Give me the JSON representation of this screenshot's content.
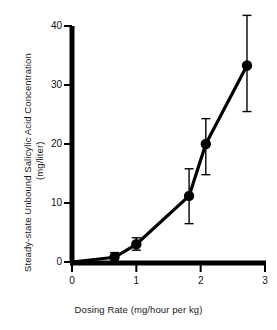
{
  "chart_data": {
    "type": "scatter",
    "title": "",
    "xlabel": "Dosing Rate (mg/hour per kg)",
    "ylabel": "Steady-state Unbound Salicylic Acid Concentration (mg/liter)",
    "ylabel_line1": "Steady-state Unbound Salicylic Acid Concentration",
    "ylabel_line2": "(mg/liter)",
    "xlim": [
      0,
      3
    ],
    "ylim": [
      0,
      40
    ],
    "xticks": [
      0,
      1,
      2,
      3
    ],
    "yticks": [
      0,
      10,
      20,
      30,
      40
    ],
    "xtick_labels": [
      "0",
      "1",
      "2",
      "3"
    ],
    "ytick_labels": [
      "0",
      "10",
      "20",
      "30",
      "40"
    ],
    "grid": false,
    "legend": false,
    "marker": "filled-circle",
    "line_style": "solid",
    "color": "#000000",
    "error_bars": "vertical",
    "x": [
      0.66,
      1.0,
      1.82,
      2.08,
      2.72
    ],
    "y": [
      0.8,
      3.0,
      11.2,
      20.0,
      33.3
    ],
    "y_err_low": [
      0.8,
      1.0,
      4.7,
      5.2,
      7.8
    ],
    "y_err_high": [
      0.8,
      1.1,
      4.6,
      4.3,
      8.5
    ],
    "points": [
      {
        "x": 0.66,
        "y": 0.8,
        "err_low": 0.8,
        "err_high": 0.8
      },
      {
        "x": 1.0,
        "y": 3.0,
        "err_low": 1.0,
        "err_high": 1.1
      },
      {
        "x": 1.82,
        "y": 11.2,
        "err_low": 4.7,
        "err_high": 4.6
      },
      {
        "x": 2.08,
        "y": 20.0,
        "err_low": 5.2,
        "err_high": 4.3
      },
      {
        "x": 2.72,
        "y": 33.3,
        "err_low": 7.8,
        "err_high": 8.5
      }
    ]
  }
}
